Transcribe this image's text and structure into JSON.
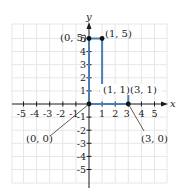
{
  "diagram": {
    "type": "coordinate-plane-polygon",
    "axes": {
      "x_label": "x",
      "y_label": "y",
      "x_ticks": [
        "-5",
        "-4",
        "-3",
        "-2",
        "-1",
        "1",
        "2",
        "3",
        "4",
        "5"
      ],
      "y_ticks": [
        "5",
        "4",
        "3",
        "2",
        "1",
        "-1",
        "-2",
        "-3",
        "-4",
        "-5"
      ],
      "x_range": [
        -5.5,
        6
      ],
      "y_range": [
        -6,
        6
      ]
    },
    "grid": true,
    "colors": {
      "grid": "#e6e6e6",
      "axis": "#1a1a1a",
      "polygon": "#4a7fb5",
      "vertex": "#111111"
    },
    "polygon_vertices": [
      [
        0,
        0
      ],
      [
        0,
        5
      ],
      [
        1,
        5
      ],
      [
        1,
        1
      ],
      [
        3,
        1
      ],
      [
        3,
        0
      ]
    ],
    "point_labels": {
      "p05": "(0, 5)",
      "p15": "(1, 5)",
      "p11": "(1, 1)",
      "p31": "(3, 1)",
      "p00": "(0, 0)",
      "p30": "(3, 0)"
    }
  }
}
